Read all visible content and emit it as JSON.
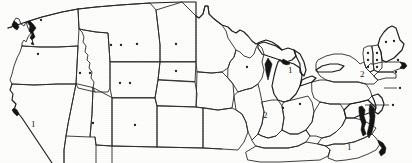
{
  "figure": {
    "kind": "outline-map",
    "region": "Contiguous United States",
    "background_color": "#fdfdfc",
    "line_color": "#2a2a2a",
    "marker_color": "#1d1d1d",
    "cropped_bottom": true
  },
  "labels": [
    {
      "id": "label-california",
      "text": "1",
      "x": 31,
      "y": 120
    },
    {
      "id": "label-michigan",
      "text": "1",
      "x": 288,
      "y": 66
    },
    {
      "id": "label-illinois",
      "text": "2",
      "x": 263,
      "y": 111
    },
    {
      "id": "label-newyork",
      "text": "2",
      "x": 360,
      "y": 70
    },
    {
      "id": "label-carolina",
      "text": "1",
      "x": 347,
      "y": 143
    }
  ],
  "markers": [
    {
      "id": "dot-washington",
      "x": 41,
      "y": 20
    },
    {
      "id": "dot-oregon",
      "x": 38,
      "y": 54
    },
    {
      "id": "dot-idaho-a",
      "x": 80,
      "y": 73
    },
    {
      "id": "dot-idaho-b",
      "x": 90,
      "y": 73
    },
    {
      "id": "dot-montana-a",
      "x": 111,
      "y": 45
    },
    {
      "id": "dot-montana-b",
      "x": 121,
      "y": 45
    },
    {
      "id": "dot-montana-c",
      "x": 137,
      "y": 44
    },
    {
      "id": "dot-northdakota",
      "x": 176,
      "y": 44
    },
    {
      "id": "dot-southdakota",
      "x": 176,
      "y": 71
    },
    {
      "id": "dot-wyoming-a",
      "x": 120,
      "y": 83
    },
    {
      "id": "dot-wyoming-b",
      "x": 130,
      "y": 83
    },
    {
      "id": "dot-utah",
      "x": 93,
      "y": 123
    },
    {
      "id": "dot-colorado",
      "x": 135,
      "y": 125
    },
    {
      "id": "dot-wisconsin",
      "x": 247,
      "y": 67
    },
    {
      "id": "dot-maine-a",
      "x": 386,
      "y": 42
    },
    {
      "id": "dot-maine-b",
      "x": 394,
      "y": 41
    },
    {
      "id": "dot-vermont-a",
      "x": 368,
      "y": 53
    },
    {
      "id": "dot-vermont-b",
      "x": 368,
      "y": 60
    },
    {
      "id": "dot-vermont-c",
      "x": 368,
      "y": 67
    },
    {
      "id": "dot-nh-a",
      "x": 377,
      "y": 53
    },
    {
      "id": "dot-nh-b",
      "x": 377,
      "y": 60
    },
    {
      "id": "dot-nh-c",
      "x": 377,
      "y": 67
    },
    {
      "id": "dot-massachusetts",
      "x": 398,
      "y": 60
    },
    {
      "id": "dot-connecticut",
      "x": 396,
      "y": 72
    },
    {
      "id": "dot-newjersey",
      "x": 400,
      "y": 88
    },
    {
      "id": "dot-delmarva",
      "x": 393,
      "y": 105
    },
    {
      "id": "dot-ohio",
      "x": 300,
      "y": 104
    },
    {
      "id": "dot-indiana",
      "x": 283,
      "y": 108
    }
  ],
  "leaders": [
    {
      "id": "leader-delmarva",
      "x1": 365,
      "y1": 105,
      "x2": 389,
      "y2": 105
    },
    {
      "id": "leader-newjersey",
      "x1": 384,
      "y1": 88,
      "x2": 397,
      "y2": 88
    }
  ]
}
